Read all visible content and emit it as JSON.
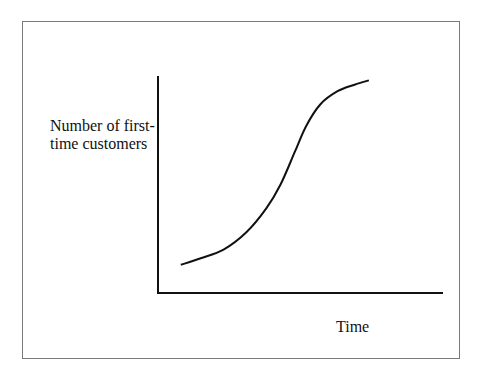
{
  "chart_data": {
    "type": "line",
    "title": "",
    "xlabel": "Time",
    "ylabel": "Number of first-\ntime customers",
    "x_ticks": [],
    "y_ticks": [],
    "grid": false,
    "legend": "none",
    "xlim": [
      0,
      10
    ],
    "ylim": [
      0,
      10
    ],
    "series": [
      {
        "name": "S-curve (adoption)",
        "color": "#111111",
        "x": [
          0.8,
          1.5,
          2.3,
          3.1,
          3.8,
          4.3,
          4.8,
          5.2,
          5.7,
          6.3,
          6.9,
          7.4
        ],
        "y": [
          1.3,
          1.6,
          2.0,
          2.8,
          3.9,
          5.0,
          6.5,
          7.7,
          8.7,
          9.3,
          9.6,
          9.8
        ]
      }
    ]
  }
}
